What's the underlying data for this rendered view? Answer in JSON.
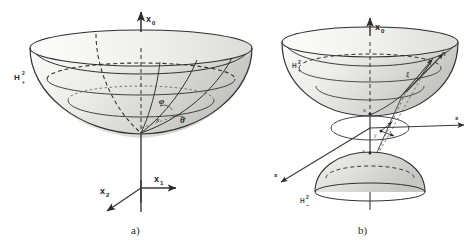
{
  "figure": {
    "title_visible": false,
    "background_color": "#ffffff",
    "ink_color": "#30302f",
    "surface_fill_light": "#e8e8e6",
    "surface_fill_mid": "#d2d2cf",
    "surface_fill_dark": "#b9b9b5",
    "width": 474,
    "height": 246
  },
  "panel_a": {
    "caption": "a)",
    "set_label": {
      "base": "H",
      "superscript": "2",
      "subscript": "+"
    },
    "axes": [
      {
        "name": "x0",
        "base": "x",
        "sub": "0",
        "direction": "up"
      },
      {
        "name": "x1",
        "base": "x",
        "sub": "1",
        "direction": "right"
      },
      {
        "name": "x2",
        "base": "x",
        "sub": "2",
        "direction": "down-left"
      }
    ],
    "angles": [
      {
        "name": "phi",
        "glyph": "φ"
      },
      {
        "name": "theta",
        "glyph": "θ"
      }
    ],
    "point_label": "x",
    "description": "Upper sheet of a two-sheeted hyperboloid drawn as an open bowl with elliptical rim, a dashed hidden latitude circle, a solid latitude circle and meridian curves, apex at origin of the x0-x1-x2 axes."
  },
  "panel_b": {
    "caption": "b)",
    "set_labels": [
      {
        "name": "upper-sheet-label",
        "base": "H",
        "superscript": "2",
        "subscript": "+"
      },
      {
        "name": "lower-sheet-label",
        "base": "H",
        "superscript": "2",
        "subscript": "−"
      }
    ],
    "axes": [
      {
        "name": "x0",
        "base": "x",
        "sub": "0",
        "direction": "up"
      },
      {
        "name": "x1",
        "base": "x",
        "sub": "1",
        "direction": "right"
      },
      {
        "name": "x2",
        "base": "x",
        "sub": "2",
        "direction": "down-left"
      }
    ],
    "markers": [
      {
        "name": "upper-vertex",
        "label": "a"
      },
      {
        "name": "lower-vertex",
        "label": "a"
      }
    ],
    "vectors": [
      {
        "name": "vector-xi",
        "glyph": "ξ"
      },
      {
        "name": "vector-eta",
        "glyph": "η"
      }
    ],
    "origin_labels": [
      {
        "name": "origin-point",
        "glyph": "0"
      },
      {
        "name": "disk-point",
        "glyph": "y"
      }
    ],
    "description": "Two-sheeted hyperboloid: upper sheet bowl above, lower sheet dome below, a shaded horizontal elliptical disk (projective/Klein disk) through the origin, with projection rays from the sheets through the disk and tangent vectors at a point on the upper sheet."
  }
}
